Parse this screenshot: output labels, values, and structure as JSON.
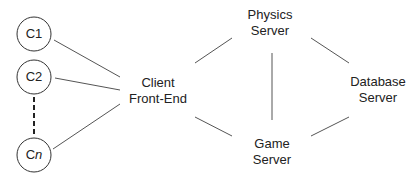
{
  "diagram": {
    "clients": [
      {
        "id": "C1",
        "label": "C1"
      },
      {
        "id": "C2",
        "label": "C2"
      },
      {
        "id": "Cn",
        "label_prefix": "C",
        "label_suffix": "n"
      }
    ],
    "client_front_end": {
      "line1": "Client",
      "line2": "Front-End"
    },
    "physics_server": {
      "line1": "Physics",
      "line2": "Server"
    },
    "game_server": {
      "line1": "Game",
      "line2": "Server"
    },
    "database_server": {
      "line1": "Database",
      "line2": "Server"
    },
    "colors": {
      "stroke": "#333333",
      "text": "#222222"
    }
  }
}
